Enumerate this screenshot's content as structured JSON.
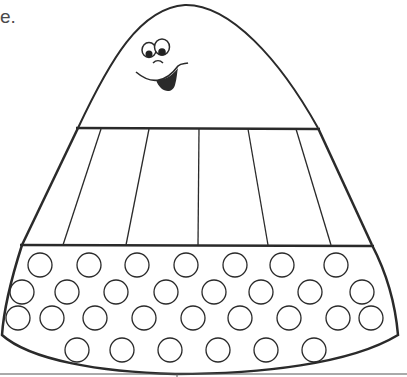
{
  "page": {
    "caption_fragment": "e.",
    "sections": [
      "top-with-face",
      "striped-middle-band",
      "dotted-bottom-band"
    ]
  },
  "colors": {
    "line": "#2a2a2a",
    "background": "#ffffff",
    "text": "#4a4a4a"
  },
  "stripes": {
    "top_x": [
      101,
      149,
      199,
      248,
      296
    ],
    "bottom_x": [
      63,
      126,
      198,
      268,
      331
    ]
  },
  "circles": {
    "radius": 12,
    "rows": [
      {
        "y": 265,
        "x": [
          40,
          89,
          137,
          186,
          235,
          282,
          336
        ]
      },
      {
        "y": 292,
        "x": [
          22,
          67,
          116,
          166,
          214,
          261,
          310,
          362
        ]
      },
      {
        "y": 318,
        "x": [
          18,
          52,
          95,
          144,
          193,
          240,
          289,
          338,
          371
        ]
      },
      {
        "y": 350,
        "x": [
          77,
          122,
          170,
          218,
          266,
          314
        ]
      }
    ]
  }
}
